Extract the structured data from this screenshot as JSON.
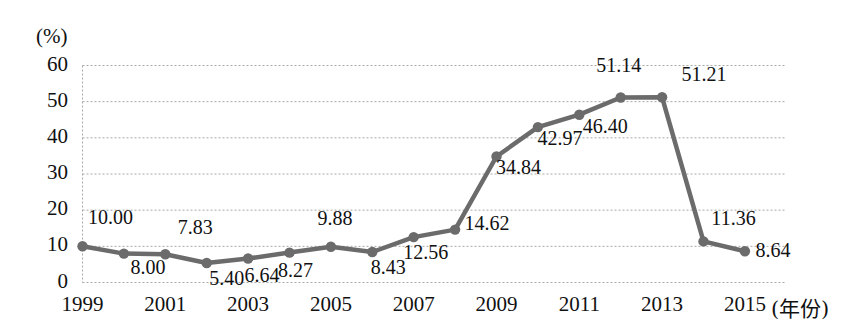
{
  "chart_data": {
    "type": "line",
    "title": "",
    "xlabel": "(年份)",
    "ylabel": "(%)",
    "x": [
      1999,
      2000,
      2001,
      2002,
      2003,
      2004,
      2005,
      2006,
      2007,
      2008,
      2009,
      2010,
      2011,
      2012,
      2013,
      2014,
      2015
    ],
    "values": [
      10.0,
      8.0,
      7.83,
      5.4,
      6.64,
      8.27,
      9.88,
      8.43,
      12.56,
      14.62,
      34.84,
      42.97,
      46.4,
      51.14,
      51.21,
      11.36,
      8.64
    ],
    "point_labels": [
      "10.00",
      "8.00",
      "7.83",
      "5.40",
      "6.64",
      "8.27",
      "9.88",
      "8.43",
      "12.56",
      "14.62",
      "34.84",
      "42.97",
      "46.40",
      "51.14",
      "51.21",
      "11.36",
      "8.64"
    ],
    "label_positions": [
      "above",
      "below",
      "above",
      "below",
      "below",
      "below",
      "above",
      "below",
      "below",
      "above",
      "below",
      "below",
      "below",
      "above",
      "above",
      "above",
      "below-right"
    ],
    "ylim": [
      0,
      60
    ],
    "y_ticks": [
      0,
      10,
      20,
      30,
      40,
      50,
      60
    ],
    "y_tick_labels": [
      "0",
      "10",
      "20",
      "30",
      "40",
      "50",
      "60"
    ],
    "x_ticks": [
      1999,
      2001,
      2003,
      2005,
      2007,
      2009,
      2011,
      2013,
      2015
    ],
    "x_tick_labels": [
      "1999",
      "2001",
      "2003",
      "2005",
      "2007",
      "2009",
      "2011",
      "2013",
      "2015"
    ],
    "grid": true,
    "grid_style": "dotted",
    "legend": false,
    "series_color": "#6b6b6b",
    "marker": "circle",
    "axis_unit": "(%)"
  }
}
